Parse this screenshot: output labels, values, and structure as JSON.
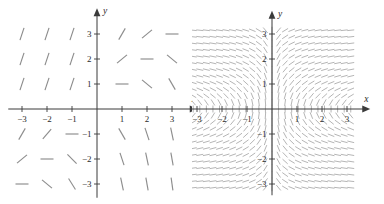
{
  "page": {
    "background_color": "#ffffff",
    "width": 384,
    "height": 204
  },
  "figures": [
    {
      "id": "left",
      "name": "sparse-slope-field",
      "axis": {
        "x_label": "x",
        "y_label": "y",
        "x_ticks": [
          "-3",
          "-2",
          "-1",
          "1",
          "2",
          "3"
        ],
        "y_ticks": [
          "3",
          "2",
          "1",
          "-1",
          "-2",
          "-3"
        ],
        "x_range": [
          -3.55,
          3.55
        ],
        "y_range": [
          -3.55,
          3.55
        ],
        "origin_px": [
          97,
          109
        ],
        "unit_px": 25.0,
        "axis_color": "#3b3b3b",
        "segment_color": "#8d8d8d"
      },
      "chart_data": {
        "type": "slope-field",
        "title": "",
        "xlabel": "x",
        "ylabel": "y",
        "xlim": [
          -3.5,
          3.5
        ],
        "ylim": [
          -3.5,
          3.5
        ],
        "grid": false,
        "legend": "none",
        "sample_x": [
          -3,
          -2,
          -1,
          0,
          1,
          2,
          3
        ],
        "sample_y": [
          -3,
          -2,
          -1,
          0,
          1,
          2,
          3
        ],
        "segment_length_px": 13,
        "description": "Sparse direction field drawn on integer lattice points; slope angle decreases monotonically as x + y increases.",
        "angles_deg_by_row_top_to_bottom": [
          [
            72,
            72,
            72,
            72,
            60,
            40,
            0
          ],
          [
            72,
            72,
            72,
            72,
            40,
            0,
            -40
          ],
          [
            72,
            72,
            72,
            60,
            0,
            -40,
            -60
          ],
          [
            72,
            72,
            60,
            0,
            -40,
            -60,
            -72
          ],
          [
            60,
            50,
            0,
            -40,
            -60,
            -72,
            -78
          ],
          [
            40,
            0,
            -45,
            -60,
            -72,
            -78,
            -80
          ],
          [
            0,
            -40,
            -58,
            -72,
            -78,
            -80,
            -82
          ]
        ]
      }
    },
    {
      "id": "right",
      "name": "dense-slope-field",
      "axis": {
        "x_label": "x",
        "y_label": "y",
        "x_ticks": [
          "-3",
          "-2",
          "-1",
          "1",
          "2",
          "3"
        ],
        "y_ticks": [
          "3",
          "2",
          "1",
          "-1",
          "-2",
          "-3"
        ],
        "x_range": [
          -3.45,
          3.45
        ],
        "y_range": [
          -3.45,
          3.45
        ],
        "origin_px": [
          80,
          109
        ],
        "unit_px": 25.0,
        "axis_color": "#3b3b3b",
        "segment_color": "#a8a8a8"
      },
      "chart_data": {
        "type": "slope-field",
        "title": "",
        "xlabel": "x",
        "ylabel": "y",
        "xlim": [
          -3.3,
          3.3
        ],
        "ylim": [
          -3.3,
          3.3
        ],
        "grid": false,
        "legend": "none",
        "sample_count_x": 25,
        "sample_count_y": 25,
        "sample_min": -3.15,
        "sample_max": 3.15,
        "segment_length_px": 7,
        "formula": "dy/dx = 1 / (x*y)",
        "description": "Dense direction field; near-vertical strokes dominate the far left and far right, with swirling near-horizontal flow along the axes producing saddle-like structure in quadrants I and III."
      }
    }
  ]
}
